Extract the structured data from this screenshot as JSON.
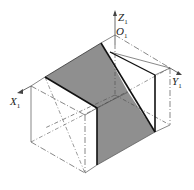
{
  "figure": {
    "type": "axonometric-projection",
    "axes": {
      "z": {
        "label": "Z",
        "subscript": "1"
      },
      "origin": {
        "label": "O",
        "subscript": "1"
      },
      "x": {
        "label": "X",
        "subscript": "1"
      },
      "y": {
        "label": "Y",
        "subscript": "1"
      }
    },
    "colors": {
      "shade": "#8f8f8f",
      "line": "#222222",
      "thin": "#555555"
    }
  }
}
